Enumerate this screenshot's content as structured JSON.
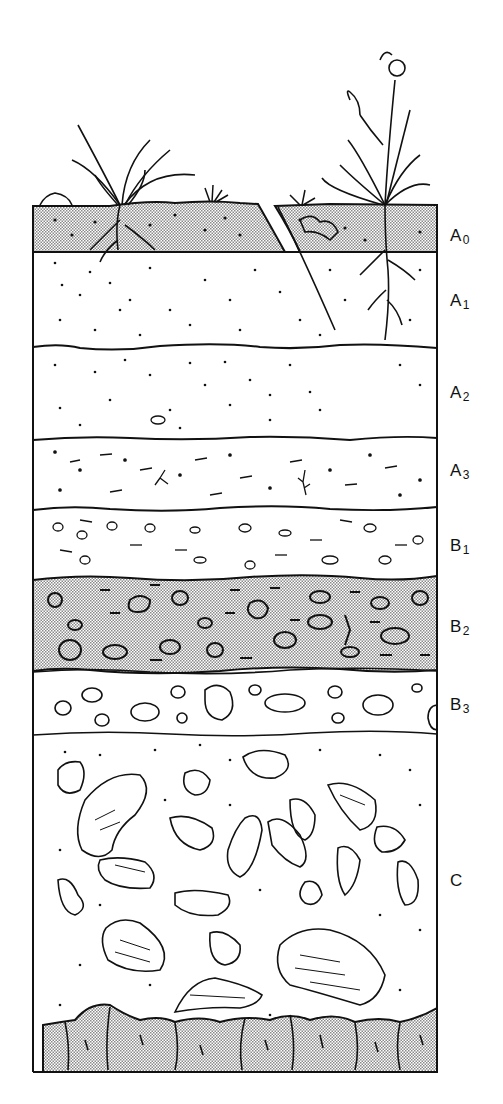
{
  "figure": {
    "type": "soil-profile-diagram",
    "colors": {
      "ink": "#111111",
      "stipple": "#bdbdbd",
      "paper": "#ffffff"
    }
  },
  "horizons": [
    {
      "id": "A0",
      "letter": "A",
      "sub": "0",
      "top": 205,
      "bottom": 252,
      "label_y": 226,
      "fill": "stippled",
      "texture": "organic litter with dots and roots"
    },
    {
      "id": "A1",
      "letter": "A",
      "sub": "1",
      "top": 252,
      "bottom": 347,
      "label_y": 291,
      "fill": "plain",
      "texture": "dense dots, roots"
    },
    {
      "id": "A2",
      "letter": "A",
      "sub": "2",
      "top": 347,
      "bottom": 438,
      "label_y": 383,
      "fill": "plain",
      "texture": "scattered dots, root mass"
    },
    {
      "id": "A3",
      "letter": "A",
      "sub": "3",
      "top": 438,
      "bottom": 508,
      "label_y": 461,
      "fill": "plain",
      "texture": "dots and dashes"
    },
    {
      "id": "B1",
      "letter": "B",
      "sub": "1",
      "top": 508,
      "bottom": 577,
      "label_y": 536,
      "fill": "plain",
      "texture": "small pebbles and dashes"
    },
    {
      "id": "B2",
      "letter": "B",
      "sub": "2",
      "top": 577,
      "bottom": 671,
      "label_y": 617,
      "fill": "stippled",
      "texture": "clay with pebbles and dashes"
    },
    {
      "id": "B3",
      "letter": "B",
      "sub": "3",
      "top": 671,
      "bottom": 733,
      "label_y": 695,
      "fill": "plain",
      "texture": "larger pebbles"
    },
    {
      "id": "C",
      "letter": "C",
      "sub": "",
      "top": 733,
      "bottom": 1010,
      "label_y": 871,
      "fill": "plain",
      "texture": "weathered rock fragments"
    },
    {
      "id": "R",
      "letter": "",
      "sub": "",
      "top": 1005,
      "bottom": 1072,
      "label_y": null,
      "fill": "stippled",
      "texture": "bedrock"
    }
  ],
  "vegetation": [
    {
      "name": "grass-clump-left",
      "x": 120
    },
    {
      "name": "small-grass-tuft",
      "x": 215
    },
    {
      "name": "flowering-plant-right",
      "x": 385
    }
  ]
}
